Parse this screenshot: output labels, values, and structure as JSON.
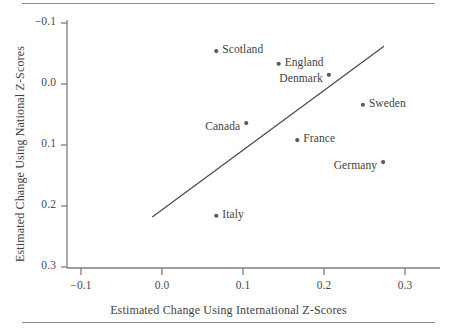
{
  "figure": {
    "name": "scatterplot-national-vs-international-z-scores",
    "background": "#ffffff",
    "ink_color": "#3f3f3f",
    "rule_color": "#8a8a8a"
  },
  "axes": {
    "x_title": "Estimated Change Using International Z-Scores",
    "y_title": "Estimated Change Using National Z-Scores",
    "x_ticks": [
      "-0.1",
      "0.0",
      "0.1",
      "0.2",
      "0.3"
    ],
    "y_ticks": [
      "0.3",
      "0.2",
      "0.1",
      "0.0",
      "-0.1"
    ]
  },
  "chart_data": {
    "type": "scatter",
    "title": "",
    "xlabel": "Estimated Change Using International Z-Scores",
    "ylabel": "Estimated Change Using National Z-Scores",
    "xlim": [
      -0.125,
      0.325
    ],
    "ylim": [
      -0.115,
      0.315
    ],
    "xticks": [
      -0.1,
      0.0,
      0.1,
      0.2,
      0.3
    ],
    "yticks": [
      -0.1,
      0.0,
      0.1,
      0.2,
      0.3
    ],
    "grid": false,
    "legend": "none",
    "points": [
      {
        "label": "Scotland",
        "x": 0.067,
        "y": 0.254,
        "label_side": "right"
      },
      {
        "label": "England",
        "x": 0.144,
        "y": 0.233,
        "label_side": "right"
      },
      {
        "label": "Denmark",
        "x": 0.206,
        "y": 0.215,
        "label_side": "left"
      },
      {
        "label": "Sweden",
        "x": 0.248,
        "y": 0.166,
        "label_side": "right"
      },
      {
        "label": "Canada",
        "x": 0.104,
        "y": 0.136,
        "label_side": "left"
      },
      {
        "label": "France",
        "x": 0.167,
        "y": 0.108,
        "label_side": "right"
      },
      {
        "label": "Germany",
        "x": 0.273,
        "y": 0.072,
        "label_side": "left"
      },
      {
        "label": "Italy",
        "x": 0.067,
        "y": -0.016,
        "label_side": "right"
      }
    ],
    "reference_line": {
      "name": "identity-trend-line",
      "x_start": -0.012,
      "y_start": -0.018,
      "x_end": 0.274,
      "y_end": 0.262
    }
  }
}
